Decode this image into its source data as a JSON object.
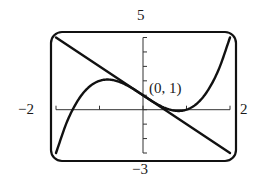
{
  "chart_data": {
    "type": "line",
    "title": "",
    "xlabel": "",
    "ylabel": "",
    "xlim": [
      -2,
      2
    ],
    "ylim": [
      -3,
      5
    ],
    "grid": false,
    "legend": null,
    "window_labels": {
      "xmin": "−2",
      "xmax": "2",
      "ymin": "−3",
      "ymax": "5"
    },
    "x_ticks": [
      -2,
      -1,
      0,
      1,
      2
    ],
    "y_ticks": [
      -3,
      -2,
      -1,
      0,
      1,
      2,
      3,
      4,
      5
    ],
    "series": [
      {
        "name": "cubic",
        "expression": "y = x^3 - 2x + 1",
        "x": [
          -2,
          -1.75,
          -1.5,
          -1.25,
          -1,
          -0.75,
          -0.5,
          -0.25,
          0,
          0.25,
          0.5,
          0.75,
          1,
          1.25,
          1.5,
          1.75,
          2
        ],
        "y": [
          -3,
          -0.859,
          0.625,
          1.547,
          2,
          2.078,
          1.875,
          1.484,
          1,
          0.516,
          0.125,
          -0.078,
          0,
          0.453,
          1.375,
          2.859,
          5
        ]
      },
      {
        "name": "tangent line",
        "expression": "y = -2x + 1",
        "x": [
          -2,
          2
        ],
        "y": [
          5,
          -3
        ]
      }
    ],
    "annotations": [
      {
        "text": "(0, 1)",
        "x": 0,
        "y": 1
      }
    ]
  },
  "labels": {
    "xmin": "−2",
    "xmax": "2",
    "ymin": "−3",
    "ymax": "5",
    "point": "(0, 1)"
  }
}
